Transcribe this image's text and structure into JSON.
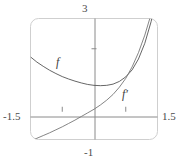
{
  "chart_data": {
    "type": "line",
    "title": "",
    "xlabel": "",
    "ylabel": "",
    "xlim": [
      -1.5,
      1.5
    ],
    "ylim": [
      -1,
      3
    ],
    "grid": false,
    "legend_position": "inline-curve-labels",
    "axis_labels": {
      "top": "3",
      "bottom": "-1",
      "left": "-1.5",
      "right": "1.5"
    },
    "x_ticks": [
      -0.75,
      0.75
    ],
    "y_ticks": [
      2
    ],
    "series": [
      {
        "name": "f",
        "label": "f",
        "color": "#555555",
        "x": [
          -1.5,
          -1.35,
          -1.2,
          -1.05,
          -0.9,
          -0.75,
          -0.6,
          -0.45,
          -0.3,
          -0.15,
          0,
          0.15,
          0.3,
          0.45,
          0.6,
          0.75,
          0.9,
          1.05,
          1.2,
          1.35,
          1.5
        ],
        "y": [
          1.73,
          1.56,
          1.42,
          1.29,
          1.18,
          1.08,
          1.0,
          0.93,
          0.87,
          0.82,
          0.79,
          0.78,
          0.79,
          0.83,
          0.92,
          1.07,
          1.3,
          1.66,
          2.18,
          2.9,
          3.85
        ]
      },
      {
        "name": "fprime",
        "label": "f′",
        "color": "#777777",
        "x": [
          -1.5,
          -1.35,
          -1.2,
          -1.05,
          -0.9,
          -0.75,
          -0.6,
          -0.45,
          -0.3,
          -0.15,
          0,
          0.15,
          0.3,
          0.45,
          0.6,
          0.75,
          0.9,
          1.05,
          1.2,
          1.35,
          1.5
        ],
        "y": [
          -1.05,
          -0.96,
          -0.87,
          -0.78,
          -0.68,
          -0.58,
          -0.47,
          -0.36,
          -0.24,
          -0.12,
          0,
          0.14,
          0.3,
          0.49,
          0.73,
          1.02,
          1.4,
          1.87,
          2.45,
          3.15,
          4.0
        ]
      }
    ]
  },
  "frame": {
    "color": "#cfcfcf",
    "axis_color": "#8a8a8a",
    "corner_radius": 8
  }
}
